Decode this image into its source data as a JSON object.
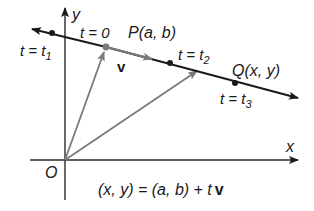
{
  "figure": {
    "type": "vector line parametrization",
    "axes": {
      "x_label": "x",
      "y_label": "y",
      "origin_label": "O"
    },
    "line_points": [
      {
        "id": "t1",
        "label": "t = t",
        "sub": "1"
      },
      {
        "id": "P",
        "label_top": "t = 0",
        "point_label": "P(a, b)"
      },
      {
        "id": "t2",
        "label": "t = t",
        "sub": "2"
      },
      {
        "id": "Q",
        "point_label": "Q(x, y)",
        "label": "t = t",
        "sub": "3"
      }
    ],
    "vector_label": "v",
    "equation": {
      "lhs": "(x, y) = (a, b) + t",
      "bold_v": "v"
    },
    "colors": {
      "line": "#1a1a1a",
      "vectors": "#7a7a7a",
      "axes": "#2a2a2a",
      "text": "#1a1a1a"
    }
  },
  "labels": {
    "y": "y",
    "x": "x",
    "o": "O",
    "t0": "t = 0",
    "p": "P(a, b)",
    "v": "v",
    "t1_main": "t = t",
    "t1_sub": "1",
    "t2_main": "t = t",
    "t2_sub": "2",
    "t3_main": "t = t",
    "t3_sub": "3",
    "q": "Q(x, y)",
    "eq_main": "(x, y) = (a, b) + t",
    "eq_v": "v"
  }
}
